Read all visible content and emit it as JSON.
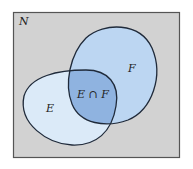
{
  "diagram": {
    "type": "venn",
    "universe_label": "N",
    "sets": [
      {
        "name": "E",
        "label": "E",
        "fill": "#dbeaf8"
      },
      {
        "name": "F",
        "label": "F",
        "fill": "#bcd6f2"
      }
    ],
    "intersection": {
      "label": "E ∩ F",
      "fill": "#8fb3e0"
    },
    "colors": {
      "background": "#d2d2d2",
      "frame": "#555555",
      "outline": "#1f2a3a"
    }
  }
}
